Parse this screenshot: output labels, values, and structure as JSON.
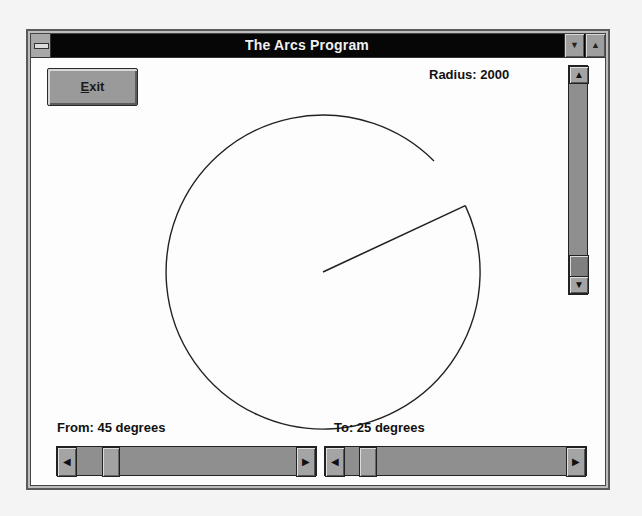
{
  "window": {
    "title": "The Arcs Program",
    "system_menu_icon": "system-menu-icon",
    "minimize_icon": "▼",
    "maximize_icon": "▲"
  },
  "toolbar": {
    "exit_label_underlined": "E",
    "exit_label_rest": "xit"
  },
  "labels": {
    "radius": "Radius: 2000",
    "from": "From: 45 degrees",
    "to": "To: 25 degrees"
  },
  "arc": {
    "radius_value": 2000,
    "from_degrees": 45,
    "to_degrees": 25,
    "center_px": [
      295,
      241
    ],
    "radius_px": 157,
    "stroke": "#222222"
  },
  "scrollbars": {
    "radius": {
      "orientation": "vertical",
      "up_icon": "▲",
      "down_icon": "▼",
      "thumb_position": "near-bottom"
    },
    "from": {
      "orientation": "horizontal",
      "left_icon": "◀",
      "right_icon": "▶",
      "value": 45
    },
    "to": {
      "orientation": "horizontal",
      "left_icon": "◀",
      "right_icon": "▶",
      "value": 25
    }
  }
}
